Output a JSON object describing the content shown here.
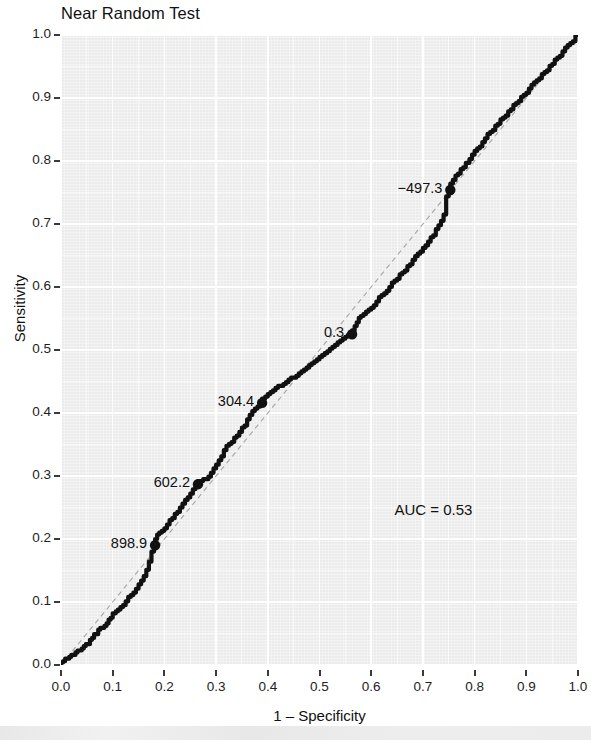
{
  "chart_data": {
    "type": "line",
    "title": "Near Random Test",
    "xlabel": "1 – Specificity",
    "ylabel": "Sensitivity",
    "xlim": [
      0.0,
      1.0
    ],
    "ylim": [
      0.0,
      1.0
    ],
    "grid": true,
    "legend": "none",
    "xticks": [
      "0.0",
      "0.1",
      "0.2",
      "0.3",
      "0.4",
      "0.5",
      "0.6",
      "0.7",
      "0.8",
      "0.9",
      "1.0"
    ],
    "yticks": [
      "0.0",
      "0.1",
      "0.2",
      "0.3",
      "0.4",
      "0.5",
      "0.6",
      "0.7",
      "0.8",
      "0.9",
      "1.0"
    ],
    "xtick_values": [
      0.0,
      0.1,
      0.2,
      0.3,
      0.4,
      0.5,
      0.6,
      0.7,
      0.8,
      0.9,
      1.0
    ],
    "ytick_values": [
      0.0,
      0.1,
      0.2,
      0.3,
      0.4,
      0.5,
      0.6,
      0.7,
      0.8,
      0.9,
      1.0
    ],
    "auc_text": "AUC = 0.53",
    "auc_value": 0.53,
    "reference_line": {
      "from": [
        0.0,
        0.0
      ],
      "to": [
        1.0,
        1.0
      ],
      "style": "dashed"
    },
    "annotations": [
      {
        "label": "898.9",
        "x": 0.182,
        "y": 0.19
      },
      {
        "label": "602.2",
        "x": 0.265,
        "y": 0.287
      },
      {
        "label": "304.4",
        "x": 0.389,
        "y": 0.416
      },
      {
        "label": "0.3",
        "x": 0.563,
        "y": 0.525
      },
      {
        "label": "−497.3",
        "x": 0.753,
        "y": 0.754
      }
    ],
    "series": [
      {
        "name": "ROC curve",
        "color": "#111111",
        "points": [
          [
            0.0,
            0.0
          ],
          [
            0.004,
            0.004
          ],
          [
            0.008,
            0.006
          ],
          [
            0.012,
            0.01
          ],
          [
            0.016,
            0.01
          ],
          [
            0.02,
            0.013
          ],
          [
            0.024,
            0.016
          ],
          [
            0.028,
            0.016
          ],
          [
            0.032,
            0.02
          ],
          [
            0.036,
            0.023
          ],
          [
            0.04,
            0.023
          ],
          [
            0.044,
            0.026
          ],
          [
            0.048,
            0.03
          ],
          [
            0.052,
            0.033
          ],
          [
            0.056,
            0.033
          ],
          [
            0.06,
            0.04
          ],
          [
            0.064,
            0.043
          ],
          [
            0.068,
            0.049
          ],
          [
            0.072,
            0.049
          ],
          [
            0.076,
            0.056
          ],
          [
            0.08,
            0.059
          ],
          [
            0.084,
            0.059
          ],
          [
            0.088,
            0.062
          ],
          [
            0.092,
            0.066
          ],
          [
            0.096,
            0.072
          ],
          [
            0.1,
            0.075
          ],
          [
            0.106,
            0.082
          ],
          [
            0.11,
            0.085
          ],
          [
            0.115,
            0.088
          ],
          [
            0.12,
            0.092
          ],
          [
            0.125,
            0.095
          ],
          [
            0.13,
            0.101
          ],
          [
            0.135,
            0.108
          ],
          [
            0.14,
            0.111
          ],
          [
            0.145,
            0.115
          ],
          [
            0.15,
            0.121
          ],
          [
            0.155,
            0.128
          ],
          [
            0.16,
            0.134
          ],
          [
            0.165,
            0.141
          ],
          [
            0.17,
            0.151
          ],
          [
            0.175,
            0.164
          ],
          [
            0.18,
            0.18
          ],
          [
            0.182,
            0.19
          ],
          [
            0.186,
            0.2
          ],
          [
            0.19,
            0.207
          ],
          [
            0.195,
            0.21
          ],
          [
            0.2,
            0.213
          ],
          [
            0.205,
            0.217
          ],
          [
            0.21,
            0.223
          ],
          [
            0.215,
            0.23
          ],
          [
            0.22,
            0.233
          ],
          [
            0.225,
            0.24
          ],
          [
            0.23,
            0.243
          ],
          [
            0.235,
            0.25
          ],
          [
            0.24,
            0.256
          ],
          [
            0.245,
            0.262
          ],
          [
            0.25,
            0.266
          ],
          [
            0.255,
            0.272
          ],
          [
            0.26,
            0.279
          ],
          [
            0.265,
            0.287
          ],
          [
            0.27,
            0.292
          ],
          [
            0.275,
            0.292
          ],
          [
            0.28,
            0.295
          ],
          [
            0.285,
            0.295
          ],
          [
            0.29,
            0.299
          ],
          [
            0.295,
            0.305
          ],
          [
            0.3,
            0.312
          ],
          [
            0.305,
            0.318
          ],
          [
            0.31,
            0.325
          ],
          [
            0.315,
            0.331
          ],
          [
            0.32,
            0.341
          ],
          [
            0.325,
            0.348
          ],
          [
            0.33,
            0.351
          ],
          [
            0.335,
            0.354
          ],
          [
            0.34,
            0.361
          ],
          [
            0.345,
            0.364
          ],
          [
            0.35,
            0.37
          ],
          [
            0.355,
            0.377
          ],
          [
            0.36,
            0.38
          ],
          [
            0.365,
            0.39
          ],
          [
            0.37,
            0.397
          ],
          [
            0.375,
            0.403
          ],
          [
            0.38,
            0.407
          ],
          [
            0.385,
            0.41
          ],
          [
            0.389,
            0.416
          ],
          [
            0.395,
            0.423
          ],
          [
            0.4,
            0.426
          ],
          [
            0.405,
            0.43
          ],
          [
            0.41,
            0.433
          ],
          [
            0.415,
            0.436
          ],
          [
            0.42,
            0.44
          ],
          [
            0.425,
            0.443
          ],
          [
            0.43,
            0.443
          ],
          [
            0.435,
            0.446
          ],
          [
            0.44,
            0.449
          ],
          [
            0.445,
            0.453
          ],
          [
            0.45,
            0.456
          ],
          [
            0.455,
            0.456
          ],
          [
            0.46,
            0.459
          ],
          [
            0.465,
            0.463
          ],
          [
            0.47,
            0.466
          ],
          [
            0.475,
            0.469
          ],
          [
            0.48,
            0.472
          ],
          [
            0.485,
            0.476
          ],
          [
            0.49,
            0.479
          ],
          [
            0.495,
            0.482
          ],
          [
            0.5,
            0.485
          ],
          [
            0.505,
            0.489
          ],
          [
            0.51,
            0.492
          ],
          [
            0.515,
            0.495
          ],
          [
            0.52,
            0.498
          ],
          [
            0.525,
            0.502
          ],
          [
            0.53,
            0.505
          ],
          [
            0.535,
            0.508
          ],
          [
            0.54,
            0.512
          ],
          [
            0.545,
            0.515
          ],
          [
            0.55,
            0.518
          ],
          [
            0.555,
            0.521
          ],
          [
            0.56,
            0.524
          ],
          [
            0.563,
            0.525
          ],
          [
            0.568,
            0.531
          ],
          [
            0.572,
            0.538
          ],
          [
            0.576,
            0.544
          ],
          [
            0.58,
            0.551
          ],
          [
            0.585,
            0.554
          ],
          [
            0.59,
            0.557
          ],
          [
            0.595,
            0.561
          ],
          [
            0.6,
            0.564
          ],
          [
            0.605,
            0.567
          ],
          [
            0.61,
            0.571
          ],
          [
            0.615,
            0.577
          ],
          [
            0.62,
            0.584
          ],
          [
            0.625,
            0.587
          ],
          [
            0.63,
            0.59
          ],
          [
            0.635,
            0.594
          ],
          [
            0.64,
            0.6
          ],
          [
            0.645,
            0.607
          ],
          [
            0.65,
            0.61
          ],
          [
            0.655,
            0.613
          ],
          [
            0.66,
            0.62
          ],
          [
            0.665,
            0.623
          ],
          [
            0.67,
            0.626
          ],
          [
            0.675,
            0.633
          ],
          [
            0.68,
            0.636
          ],
          [
            0.685,
            0.643
          ],
          [
            0.69,
            0.649
          ],
          [
            0.695,
            0.653
          ],
          [
            0.7,
            0.656
          ],
          [
            0.705,
            0.662
          ],
          [
            0.71,
            0.666
          ],
          [
            0.715,
            0.672
          ],
          [
            0.72,
            0.679
          ],
          [
            0.725,
            0.682
          ],
          [
            0.73,
            0.692
          ],
          [
            0.735,
            0.698
          ],
          [
            0.74,
            0.705
          ],
          [
            0.745,
            0.715
          ],
          [
            0.75,
            0.744
          ],
          [
            0.753,
            0.754
          ],
          [
            0.758,
            0.764
          ],
          [
            0.763,
            0.77
          ],
          [
            0.768,
            0.777
          ],
          [
            0.773,
            0.78
          ],
          [
            0.778,
            0.787
          ],
          [
            0.783,
            0.79
          ],
          [
            0.79,
            0.797
          ],
          [
            0.795,
            0.803
          ],
          [
            0.8,
            0.81
          ],
          [
            0.805,
            0.816
          ],
          [
            0.81,
            0.82
          ],
          [
            0.815,
            0.823
          ],
          [
            0.82,
            0.83
          ],
          [
            0.825,
            0.836
          ],
          [
            0.83,
            0.843
          ],
          [
            0.835,
            0.846
          ],
          [
            0.84,
            0.849
          ],
          [
            0.845,
            0.856
          ],
          [
            0.85,
            0.859
          ],
          [
            0.855,
            0.866
          ],
          [
            0.86,
            0.869
          ],
          [
            0.865,
            0.872
          ],
          [
            0.87,
            0.879
          ],
          [
            0.875,
            0.882
          ],
          [
            0.88,
            0.889
          ],
          [
            0.885,
            0.892
          ],
          [
            0.89,
            0.895
          ],
          [
            0.895,
            0.902
          ],
          [
            0.9,
            0.905
          ],
          [
            0.905,
            0.908
          ],
          [
            0.91,
            0.915
          ],
          [
            0.915,
            0.921
          ],
          [
            0.92,
            0.925
          ],
          [
            0.925,
            0.928
          ],
          [
            0.93,
            0.931
          ],
          [
            0.935,
            0.938
          ],
          [
            0.94,
            0.941
          ],
          [
            0.945,
            0.944
          ],
          [
            0.95,
            0.951
          ],
          [
            0.955,
            0.954
          ],
          [
            0.96,
            0.961
          ],
          [
            0.965,
            0.964
          ],
          [
            0.97,
            0.967
          ],
          [
            0.975,
            0.974
          ],
          [
            0.98,
            0.98
          ],
          [
            0.985,
            0.984
          ],
          [
            0.99,
            0.987
          ],
          [
            0.995,
            0.99
          ],
          [
            1.0,
            1.0
          ]
        ]
      }
    ]
  },
  "colors": {
    "panel_background": "#ebebeb",
    "gridline": "#ffffff",
    "curve": "#111111",
    "text": "#111111"
  }
}
